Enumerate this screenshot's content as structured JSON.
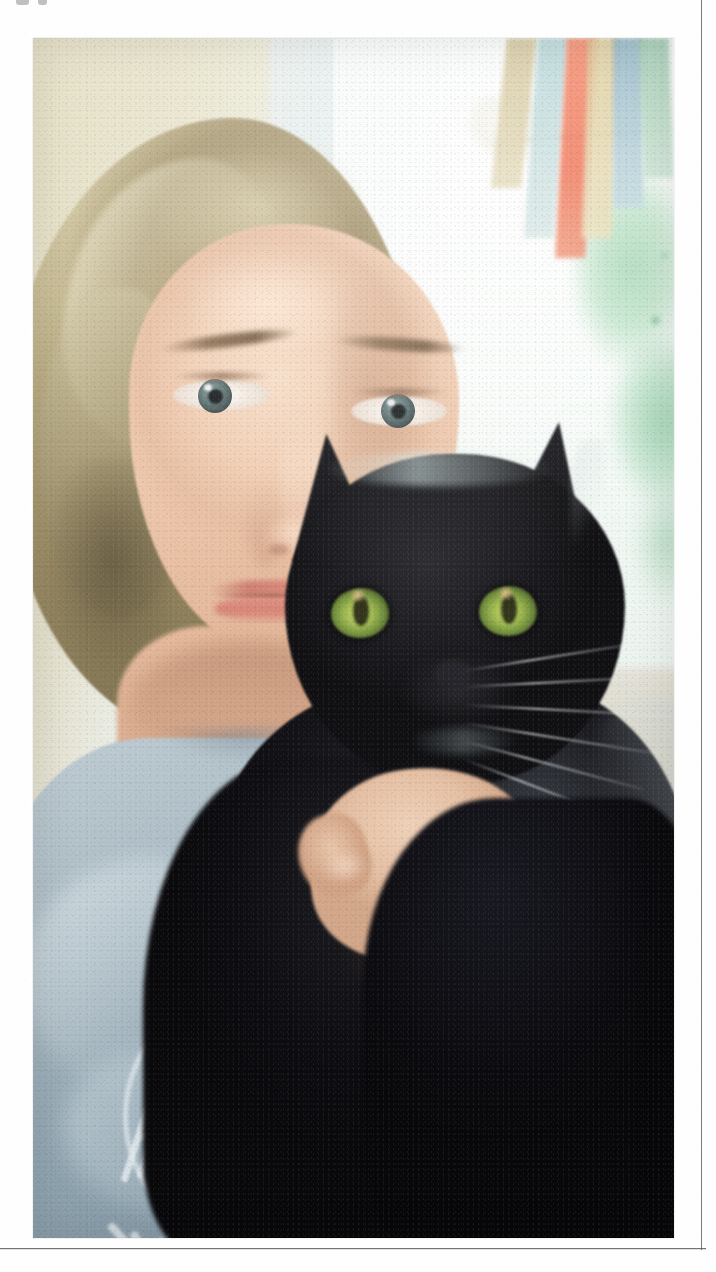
{
  "page": {
    "kind": "scanned-page",
    "width": 716,
    "height": 1272,
    "background_color": "#ffffff",
    "border_rule_color": "#5a5a5a",
    "top_cut_marks_label": "cut-off ink marks"
  },
  "photo": {
    "name": "portrait-photo",
    "caption": "Selfie portrait of a light-haired person holding a black cat up beside their face, in front of a bright window with colourful hanging bunting.",
    "alt": "Person with shoulder-length blonde hair holding a black cat near their cheek",
    "frame": {
      "left": 33,
      "top": 38,
      "width": 641,
      "height": 1200
    },
    "colors": {
      "hair": "#c4b88e",
      "skin": "#efc9ad",
      "shirt": "#aebfc8",
      "cat_fur": "#131317",
      "cat_eye_green": "#9fba4f",
      "window_light": "#f3f8f4",
      "foliage_green": "#8fcfa4",
      "flag_red": "#ef5f3c",
      "flag_gold": "#d8c48c",
      "flag_teal": "#a9cfd2",
      "flag_blue": "#7fa9bb"
    },
    "subjects": [
      {
        "name": "person",
        "description": "Light blonde shoulder-length wavy hair, grey-blue eyes, neutral expression, wearing a pale blue-grey t-shirt"
      },
      {
        "name": "cat",
        "description": "Black cat with large green-yellow eyes, upright ears, long white whiskers, held up against the person's face"
      }
    ],
    "background": {
      "name": "window-scene",
      "elements": [
        "bright window with daylight",
        "green foliage visible outside",
        "hanging triangular bunting flags",
        "pale beige curtain or wall on the left",
        "light blanket or sofa at lower right"
      ]
    },
    "shirt_graphic": {
      "name": "t-shirt-badge",
      "description": "Circular white line badge with stacked angular monogram letters and curved lettering along the bottom arc, partly cropped by the photo edge",
      "monogram_letters": "AM",
      "ink_color": "#f3f9fb"
    }
  }
}
